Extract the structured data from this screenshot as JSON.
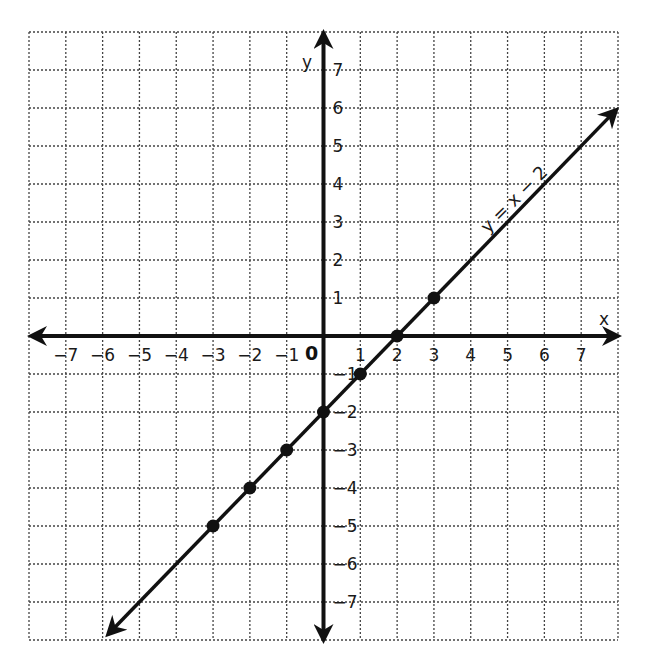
{
  "chart_data": {
    "type": "line",
    "title": "",
    "equation_label": "y = x − 2",
    "xlabel": "x",
    "ylabel": "y",
    "origin_label": "0",
    "xlim": [
      -8,
      8
    ],
    "ylim": [
      -8,
      8
    ],
    "grid": true,
    "grid_style": "dotted",
    "x_ticks": [
      -7,
      -6,
      -5,
      -4,
      -3,
      -2,
      -1,
      1,
      2,
      3,
      4,
      5,
      6,
      7
    ],
    "y_ticks": [
      -7,
      -6,
      -5,
      -4,
      -3,
      -2,
      -1,
      1,
      2,
      3,
      4,
      5,
      6,
      7
    ],
    "series": [
      {
        "name": "y = x − 2",
        "slope": 1,
        "intercept": -2,
        "line_extends_both_ways": true,
        "points": [
          {
            "x": -3,
            "y": -5
          },
          {
            "x": -2,
            "y": -4
          },
          {
            "x": -1,
            "y": -3
          },
          {
            "x": 0,
            "y": -2
          },
          {
            "x": 1,
            "y": -1
          },
          {
            "x": 2,
            "y": 0
          },
          {
            "x": 3,
            "y": 1
          }
        ]
      }
    ],
    "colors": {
      "line": "#111111",
      "axes": "#111111",
      "grid": "#444444",
      "background": "#ffffff"
    }
  }
}
